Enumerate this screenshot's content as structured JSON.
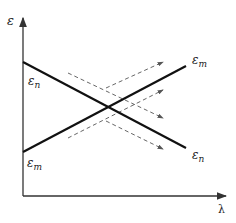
{
  "diagram": {
    "axes": {
      "y_label": "ε",
      "x_label": "λ"
    },
    "lines": [
      {
        "name": "epsilon-n-line",
        "start_label": "ε",
        "start_sub": "n",
        "end_label": "ε",
        "end_sub": "n",
        "direction": "decreasing"
      },
      {
        "name": "epsilon-m-line",
        "start_label": "ε",
        "start_sub": "m",
        "end_label": "ε",
        "end_sub": "m",
        "direction": "increasing"
      }
    ],
    "colors": {
      "line": "#111111",
      "dashed": "#555555",
      "axis": "#333333"
    }
  }
}
